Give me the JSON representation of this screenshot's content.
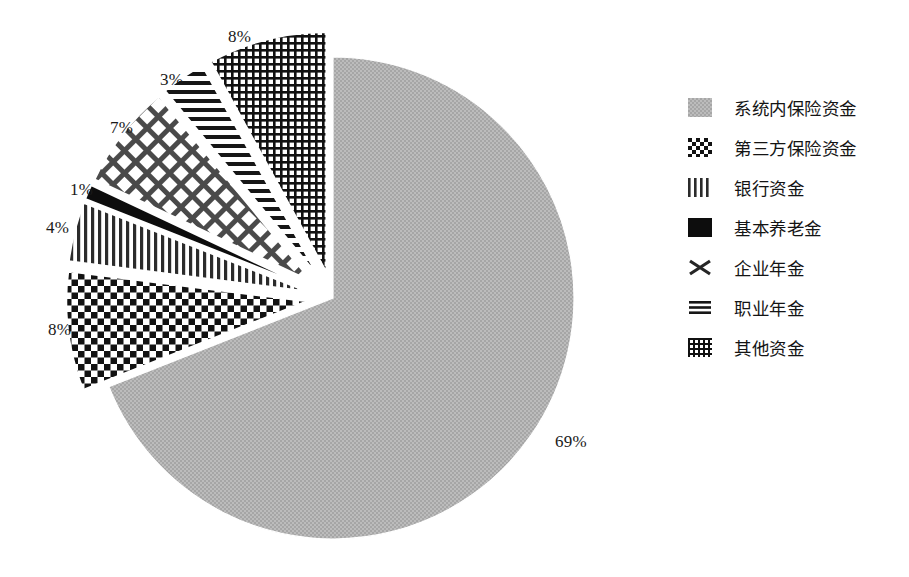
{
  "chart_data": {
    "type": "pie",
    "title": "",
    "subtitle": "",
    "xlabel": "",
    "ylabel": "",
    "grid": false,
    "legend_position": "right",
    "start_angle_deg": 90,
    "direction": "clockwise",
    "units": "percent",
    "categories": [
      "系统内保险资金",
      "第三方保险资金",
      "银行资金",
      "基本养老金",
      "企业年金",
      "职业年金",
      "其他资金"
    ],
    "values": [
      69,
      8,
      4,
      1,
      7,
      3,
      8
    ],
    "labels": [
      "69%",
      "8%",
      "4%",
      "1%",
      "7%",
      "3%",
      "8%"
    ],
    "exploded": [
      false,
      true,
      true,
      true,
      true,
      true,
      true
    ],
    "patterns": [
      "solid-gray-dither",
      "checkerboard",
      "vertical-lines",
      "solid-black",
      "diagonal-crosshatch",
      "horizontal-lines",
      "fine-grid"
    ],
    "series": [
      {
        "name": "资金来源占比",
        "values": [
          69,
          8,
          4,
          1,
          7,
          3,
          8
        ]
      }
    ],
    "slices": [
      {
        "label": "系统内保险资金",
        "value": 69,
        "display": "69%",
        "pattern": "solid-gray-dither",
        "exploded": false
      },
      {
        "label": "第三方保险资金",
        "value": 8,
        "display": "8%",
        "pattern": "checkerboard",
        "exploded": true
      },
      {
        "label": "银行资金",
        "value": 4,
        "display": "4%",
        "pattern": "vertical-lines",
        "exploded": true
      },
      {
        "label": "基本养老金",
        "value": 1,
        "display": "1%",
        "pattern": "solid-black",
        "exploded": true
      },
      {
        "label": "企业年金",
        "value": 7,
        "display": "7%",
        "pattern": "diagonal-crosshatch",
        "exploded": true
      },
      {
        "label": "职业年金",
        "value": 3,
        "display": "3%",
        "pattern": "horizontal-lines",
        "exploded": true
      },
      {
        "label": "其他资金",
        "value": 8,
        "display": "8%",
        "pattern": "fine-grid",
        "exploded": true
      }
    ]
  },
  "pie_labels": [
    {
      "text": "8%",
      "x": 228,
      "y": 27
    },
    {
      "text": "3%",
      "x": 160,
      "y": 70
    },
    {
      "text": "7%",
      "x": 110,
      "y": 118
    },
    {
      "text": "1%",
      "x": 70,
      "y": 180
    },
    {
      "text": "4%",
      "x": 46,
      "y": 218
    },
    {
      "text": "8%",
      "x": 48,
      "y": 320
    },
    {
      "text": "69%",
      "x": 555,
      "y": 432
    }
  ],
  "legend": {
    "items": [
      {
        "label": "系统内保险资金",
        "pattern": "solid-gray-dither",
        "swatch_name": "swatch-gray-dither"
      },
      {
        "label": "第三方保险资金",
        "pattern": "checkerboard",
        "swatch_name": "swatch-checkerboard"
      },
      {
        "label": "银行资金",
        "pattern": "vertical-lines",
        "swatch_name": "swatch-vertical-lines"
      },
      {
        "label": "基本养老金",
        "pattern": "solid-black",
        "swatch_name": "swatch-solid-black"
      },
      {
        "label": "企业年金",
        "pattern": "diagonal-crosshatch",
        "swatch_name": "swatch-crosshatch"
      },
      {
        "label": "职业年金",
        "pattern": "horizontal-lines",
        "swatch_name": "swatch-horizontal-lines"
      },
      {
        "label": "其他资金",
        "pattern": "fine-grid",
        "swatch_name": "swatch-fine-grid"
      }
    ]
  },
  "colors": {
    "background": "#ffffff",
    "ink": "#141414",
    "gray_fill": "#b2b2b2",
    "pattern_stroke": "#1a1a1a"
  }
}
